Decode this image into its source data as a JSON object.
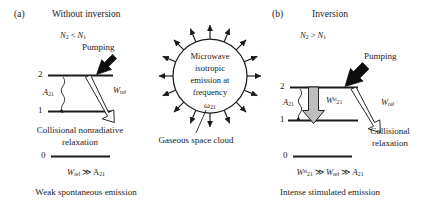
{
  "figure": {
    "type": "energy-level-and-emission-diagram",
    "background": "#ffffff",
    "ink": "#1a1a1a",
    "arrow_fill_grey": "#b8b8b8"
  },
  "panel_a": {
    "tag": "(a)",
    "title": "Without inversion",
    "population_condition": "N₂ < N₁",
    "pumping_label": "Pumping",
    "level_upper_label": "2",
    "level_lower_label": "1",
    "level_ground_label": "0",
    "spontaneous_label": "A₂₁",
    "relaxation_label": "W",
    "relaxation_sub": "rel",
    "relaxation_caption_line1": "Collisional nonradiative",
    "relaxation_caption_line2": "relaxation",
    "inequality": "W_rel ≫ A₂₁",
    "inequality_parts": {
      "left": "W",
      "left_sub": "rel",
      "op": "≫",
      "right": "A",
      "right_sub": "21"
    },
    "conclusion": "Weak spontaneous emission"
  },
  "panel_b": {
    "tag": "(b)",
    "title": "Inversion",
    "population_condition": "N₂ > N₁",
    "pumping_label": "Pumping",
    "level_upper_label": "2",
    "level_lower_label": "1",
    "level_ground_label": "0",
    "spontaneous_label": "A₂₁",
    "stimulated_label": "W",
    "stimulated_sub": "21",
    "stimulated_sup": "st",
    "relaxation_label": "W",
    "relaxation_sub": "rel",
    "relaxation_caption_line1": "Collisional",
    "relaxation_caption_line2": "relaxation",
    "inequality": "W₂₁^st ≫ W_rel ≫ A₂₁",
    "conclusion": "Intense stimulated emission"
  },
  "cloud": {
    "line1": "Microwave",
    "line2": "isotropic",
    "line3": "emission at",
    "line4": "frequency",
    "frequency_label": "ω",
    "frequency_sub": "21",
    "callout": "Gaseous space cloud",
    "ray_count": 16
  }
}
